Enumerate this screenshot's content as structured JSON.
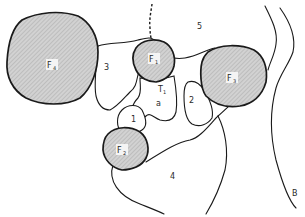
{
  "diagram": {
    "type": "anatomical region map",
    "colors": {
      "stroke": "#1a1a1a",
      "shaded_fill": "#c8c8c8",
      "background": "#ffffff"
    },
    "shaded_regions": [
      {
        "id": "F4",
        "label": "F",
        "subscript": "4"
      },
      {
        "id": "F1",
        "label": "F",
        "subscript": "1"
      },
      {
        "id": "F3",
        "label": "F",
        "subscript": "3"
      },
      {
        "id": "F2",
        "label": "F",
        "subscript": "2"
      }
    ],
    "regions": [
      {
        "id": "3",
        "label": "3"
      },
      {
        "id": "5",
        "label": "5"
      },
      {
        "id": "T1",
        "label": "T",
        "subscript": "1"
      },
      {
        "id": "a",
        "label": "a"
      },
      {
        "id": "1",
        "label": "1"
      },
      {
        "id": "2",
        "label": "2"
      },
      {
        "id": "4",
        "label": "4"
      }
    ],
    "boundary_label": "B"
  }
}
